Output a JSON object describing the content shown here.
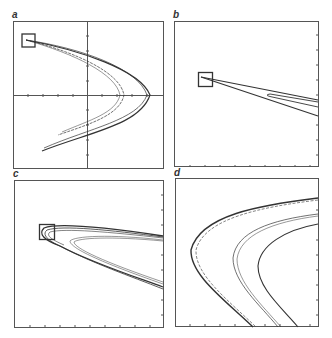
{
  "figure": {
    "panels": [
      {
        "label": "a",
        "description": "Full attractor with axes and inset box at upper left"
      },
      {
        "label": "b",
        "description": "Magnification of boxed region in a"
      },
      {
        "label": "c",
        "description": "Magnification of boxed region in b"
      },
      {
        "label": "d",
        "description": "Magnification of boxed region in c"
      }
    ],
    "line_color": "#333333",
    "frame_color": "#555555"
  }
}
